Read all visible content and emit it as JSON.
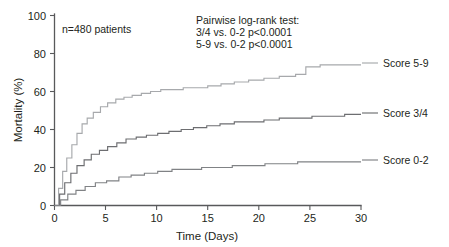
{
  "chart_data": {
    "type": "line",
    "title": "",
    "subtitle": "",
    "xlabel": "Time (Days)",
    "ylabel": "Mortality (%)",
    "xlim": [
      0,
      30
    ],
    "ylim": [
      0,
      100
    ],
    "xticks": [
      "0",
      "5",
      "10",
      "15",
      "20",
      "25",
      "30"
    ],
    "yticks": [
      "0",
      "20",
      "40",
      "60",
      "80",
      "100"
    ],
    "grid": false,
    "legend_position": "right-inline",
    "step_style": "post",
    "annotations": [
      "n=480 patients",
      "Pairwise log-rank test:",
      "3/4 vs. 0-2 p<0.0001",
      "5-9 vs. 0-2 p<0.0001"
    ],
    "series": [
      {
        "name": "Score 5-9",
        "color": "#a7a9ac",
        "label_y_pct": 74,
        "x": [
          0,
          0.4,
          0.8,
          1.2,
          1.7,
          2.2,
          2.7,
          3.2,
          3.8,
          4.5,
          5.2,
          6.0,
          6.8,
          7.6,
          8.5,
          9.4,
          10.4,
          11.5,
          12.6,
          13.8,
          15.0,
          16.3,
          17.6,
          19.0,
          20.5,
          22.0,
          23.6,
          24.6,
          26.0,
          28.0,
          30.0
        ],
        "values": [
          0,
          9,
          18,
          25,
          32,
          38,
          43,
          46,
          49,
          52,
          54,
          56,
          57,
          58,
          59,
          60,
          61,
          61,
          62,
          62,
          63,
          64,
          65,
          66,
          67,
          68,
          69,
          73,
          74,
          74,
          74
        ]
      },
      {
        "name": "Score 3/4",
        "color": "#6d6e71",
        "label_y_pct": 48,
        "x": [
          0,
          0.5,
          1.0,
          1.6,
          2.2,
          2.9,
          3.6,
          4.4,
          5.2,
          6.1,
          7.0,
          8.0,
          9.0,
          10.1,
          11.2,
          12.4,
          13.6,
          14.9,
          16.2,
          17.6,
          19.0,
          20.5,
          22.0,
          23.6,
          25.2,
          26.8,
          28.4,
          30.0
        ],
        "values": [
          0,
          6,
          12,
          17,
          21,
          24,
          27,
          29,
          31,
          33,
          35,
          36,
          37,
          38,
          39,
          40,
          41,
          42,
          43,
          44,
          44,
          45,
          46,
          46,
          47,
          47,
          48,
          48
        ]
      },
      {
        "name": "Score 0-2",
        "color": "#808285",
        "label_y_pct": 23,
        "x": [
          0,
          0.6,
          1.3,
          2.1,
          3.0,
          4.0,
          5.1,
          6.3,
          7.5,
          8.8,
          10.1,
          11.5,
          12.9,
          14.4,
          15.9,
          17.4,
          19.0,
          20.6,
          22.2,
          23.8,
          25.4,
          27.0,
          28.5,
          30.0
        ],
        "values": [
          0,
          3,
          6,
          8,
          10,
          12,
          13,
          15,
          16,
          17,
          18,
          19,
          19,
          20,
          20,
          21,
          21,
          22,
          22,
          23,
          23,
          23,
          23,
          23
        ]
      }
    ]
  },
  "notes": {
    "sample_size": "n=480 patients"
  },
  "test_block": {
    "line1": "Pairwise log-rank test:",
    "line2": "3/4 vs. 0-2 p<0.0001",
    "line3": "5-9 vs. 0-2 p<0.0001"
  },
  "axes": {
    "y_title": "Mortality (%)",
    "x_title": "Time (Days)",
    "y_ticks": [
      "100",
      "80",
      "60",
      "40",
      "20",
      "0"
    ],
    "x_ticks": [
      "0",
      "5",
      "10",
      "15",
      "20",
      "25",
      "30"
    ]
  },
  "series_labels": {
    "top": "Score 5-9",
    "mid": "Score 3/4",
    "bot": "Score 0-2"
  }
}
